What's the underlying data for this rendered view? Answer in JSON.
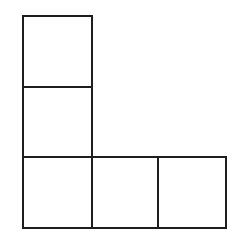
{
  "diagram": {
    "type": "polyomino-L",
    "line_color": "#1e1e1e",
    "background": "#ffffff",
    "cell_count": 5,
    "cells": [
      {
        "id": "top",
        "row": 0,
        "col": 0,
        "x": 22,
        "y": 15,
        "w": 71,
        "h": 73
      },
      {
        "id": "middle",
        "row": 1,
        "col": 0,
        "x": 22,
        "y": 86,
        "w": 71,
        "h": 72
      },
      {
        "id": "bottom-left",
        "row": 2,
        "col": 0,
        "x": 22,
        "y": 156,
        "w": 71,
        "h": 73
      },
      {
        "id": "bottom-center",
        "row": 2,
        "col": 1,
        "x": 91,
        "y": 156,
        "w": 68,
        "h": 73
      },
      {
        "id": "bottom-right",
        "row": 2,
        "col": 2,
        "x": 157,
        "y": 156,
        "w": 70,
        "h": 73
      }
    ]
  }
}
